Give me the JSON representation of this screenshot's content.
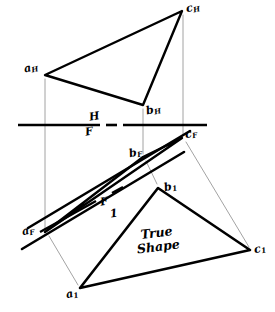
{
  "figure": {
    "type": "descriptive-geometry-orthographic-projection",
    "annotation": "True Shape",
    "background_color": "#ffffff",
    "ink_color": "#000000",
    "construction_color": "#8c8c8c"
  },
  "labels": {
    "a_h": {
      "letter": "a",
      "sub": "H"
    },
    "b_h": {
      "letter": "b",
      "sub": "H"
    },
    "c_h": {
      "letter": "c",
      "sub": "H"
    },
    "a_f": {
      "letter": "a",
      "sub": "F"
    },
    "b_f": {
      "letter": "b",
      "sub": "F"
    },
    "c_f": {
      "letter": "c",
      "sub": "F"
    },
    "a_1": {
      "letter": "a",
      "sub": "1"
    },
    "b_1": {
      "letter": "b",
      "sub": "1"
    },
    "c_1": {
      "letter": "c",
      "sub": "1"
    },
    "fold_hf_top": "H",
    "fold_hf_bottom": "F",
    "fold_f1_top": "F",
    "fold_f1_bottom": "1",
    "true_shape_line1": "True",
    "true_shape_line2": "Shape"
  },
  "geometry": {
    "top_view_triangle": {
      "name": "horizontal-projection-triangle",
      "points": [
        [
          45,
          75
        ],
        [
          143,
          105
        ],
        [
          182,
          11
        ]
      ]
    },
    "front_view_triangle": {
      "name": "frontal-projection-triangle",
      "points": [
        [
          45,
          232
        ],
        [
          143,
          157
        ],
        [
          182,
          138
        ]
      ]
    },
    "true_shape_triangle": {
      "name": "auxiliary-true-shape-triangle",
      "points": [
        [
          80,
          288
        ],
        [
          158,
          188
        ],
        [
          250,
          250
        ]
      ]
    },
    "fold_line_hf": {
      "name": "fold-line-h-f",
      "segments": [
        [
          [
            18,
            125
          ],
          [
            100,
            125
          ]
        ],
        [
          [
            106,
            125
          ],
          [
            117,
            125
          ]
        ],
        [
          [
            123,
            125
          ],
          [
            207,
            125
          ]
        ]
      ]
    },
    "fold_line_f1": {
      "name": "fold-line-f-1",
      "segments": [
        [
          [
            40,
            232
          ],
          [
            96,
            201
          ]
        ],
        [
          [
            112,
            193
          ],
          [
            123,
            187
          ]
        ]
      ]
    },
    "construction_lines": [
      {
        "name": "projector-a",
        "from": [
          45,
          79
        ],
        "to": [
          45,
          229
        ]
      },
      {
        "name": "projector-b",
        "from": [
          143,
          109
        ],
        "to": [
          143,
          154
        ]
      },
      {
        "name": "projector-c",
        "from": [
          183,
          15
        ],
        "to": [
          183,
          135
        ]
      },
      {
        "name": "aux-projector-a",
        "from": [
          49,
          236
        ],
        "to": [
          78,
          285
        ]
      },
      {
        "name": "aux-projector-b",
        "from": [
          146,
          161
        ],
        "to": [
          157,
          184
        ]
      },
      {
        "name": "aux-projector-c",
        "from": [
          186,
          142
        ],
        "to": [
          249,
          247
        ]
      }
    ],
    "aux_reference_strokes": [
      {
        "name": "aux-ref-upper",
        "from": [
          28,
          228
        ],
        "to": [
          190,
          131
        ]
      },
      {
        "name": "aux-ref-lower",
        "from": [
          22,
          249
        ],
        "to": [
          184,
          152
        ]
      }
    ]
  },
  "label_positions": {
    "a_h": [
      24,
      62
    ],
    "b_h": [
      146,
      104
    ],
    "c_h": [
      186,
      2
    ],
    "a_f": [
      22,
      225
    ],
    "b_f": [
      129,
      147
    ],
    "c_f": [
      185,
      128
    ],
    "a_1": [
      66,
      288
    ],
    "b_1": [
      164,
      181
    ],
    "c_1": [
      254,
      243
    ],
    "fold_hf_top": [
      89,
      111
    ],
    "fold_hf_bottom": [
      85,
      126
    ],
    "fold_f1_top": [
      100,
      196
    ],
    "fold_f1_bottom": [
      110,
      208
    ],
    "true_shape": [
      136,
      226
    ]
  }
}
